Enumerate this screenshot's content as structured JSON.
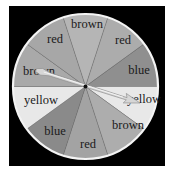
{
  "spinner": {
    "center": [
      85.5,
      86.5
    ],
    "radius": 72.5,
    "rim_color": "#f4f4f4",
    "frame_color": "#000000",
    "segments": [
      {
        "label": "brown",
        "color": "#b5b5b5",
        "start": -108,
        "end": -72,
        "label_pos": [
          87,
          28
        ]
      },
      {
        "label": "red",
        "color": "#acacac",
        "start": -72,
        "end": -36,
        "label_pos": [
          123,
          44
        ]
      },
      {
        "label": "blue",
        "color": "#8f8f8f",
        "start": -36,
        "end": 0,
        "label_pos": [
          139,
          74
        ]
      },
      {
        "label": "yellow",
        "color": "#e8e8e8",
        "start": 0,
        "end": 36,
        "label_pos": [
          144,
          103
        ]
      },
      {
        "label": "brown",
        "color": "#adadad",
        "start": 36,
        "end": 72,
        "label_pos": [
          128,
          129
        ]
      },
      {
        "label": "red",
        "color": "#a3a3a3",
        "start": 72,
        "end": 108,
        "label_pos": [
          88,
          148
        ]
      },
      {
        "label": "blue",
        "color": "#8a8a8a",
        "start": 108,
        "end": 144,
        "label_pos": [
          55,
          135
        ]
      },
      {
        "label": "yellow",
        "color": "#e8e8e8",
        "start": 144,
        "end": 180,
        "label_pos": [
          41,
          104
        ]
      },
      {
        "label": "brown",
        "color": "#a9a9a9",
        "start": 180,
        "end": 216,
        "label_pos": [
          39,
          75
        ]
      },
      {
        "label": "red",
        "color": "#a7a7a7",
        "start": 216,
        "end": 252,
        "label_pos": [
          55,
          43
        ]
      }
    ],
    "pointer": {
      "tail": [
        36,
        70
      ],
      "tip": [
        140,
        103
      ],
      "color": "#d6d6d6",
      "outline": "#8c8c8c"
    },
    "hub_color": "#111111"
  }
}
